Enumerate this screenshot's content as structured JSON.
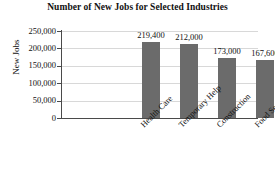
{
  "chart_data": {
    "type": "bar",
    "title": "Number of New Jobs for Selected Industries",
    "xlabel": "",
    "ylabel": "New Jobs",
    "categories": [
      "Health Care",
      "Temporary Help",
      "Construction",
      "Food Service",
      "Retail"
    ],
    "values": [
      219400,
      212000,
      173000,
      167600,
      78600
    ],
    "value_labels": [
      "219,400",
      "212,000",
      "173,000",
      "167,600",
      "78,600"
    ],
    "ylim": [
      0,
      250000
    ],
    "ytick_values": [
      250000,
      200000,
      150000,
      100000,
      50000,
      0
    ],
    "ytick_labels": [
      "250,000",
      "200,000",
      "150,000",
      "100,000",
      "50,000",
      "0"
    ],
    "grid": true,
    "legend": false,
    "legend_position": "none",
    "bar_color": "#6b6b6b",
    "gridline_color": "#d8d8d8",
    "axis_color": "#4a4a4a",
    "background_color": "#ffffff",
    "text_color": "#111111"
  }
}
